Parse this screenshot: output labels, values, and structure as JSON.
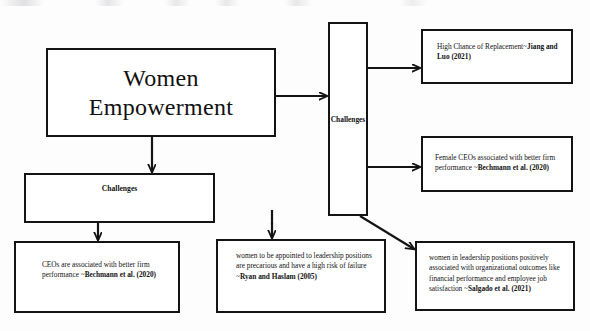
{
  "diagram": {
    "title_box": {
      "line1": "Women",
      "line2": "Empowerment"
    },
    "left_challenges": {
      "label": "Challenges"
    },
    "center_challenges": {
      "label": "Challenges"
    },
    "right_boxes": [
      {
        "text": "High Chance of Replacement~",
        "citation": "Jiang and Luo (2021)"
      },
      {
        "text": "Female CEOs associated with better firm performance ~",
        "citation": "Bechmann et al. (2020)"
      },
      {
        "text": "women in  leadership positions positively associated with organizational outcomes like financial performance and employee job satisfaction ~",
        "citation": "Salgado et al. (2021)"
      }
    ],
    "bottom_boxes": [
      {
        "text": "CEOs are associated with better firm performance ~",
        "citation": "Bechmann et al. (2020)"
      },
      {
        "text": "women to be appointed to leadership positions are precarious and have a high risk of failure ~",
        "citation": "Ryan and Haslam (2005)"
      }
    ],
    "colors": {
      "stroke": "#141414",
      "background": "#ffffff",
      "text": "#111111"
    }
  }
}
